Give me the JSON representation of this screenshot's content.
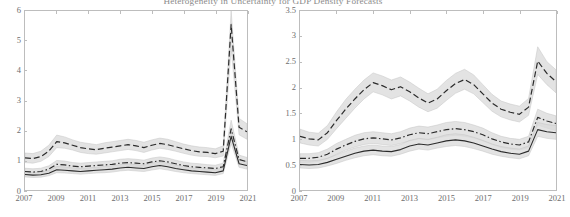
{
  "figure": {
    "title": "Heterogeneity in Uncertainty for GDP Density Forecasts",
    "background_color": "#ffffff",
    "axis_color": "#bdbdbd",
    "band_color": "#d9d9d9",
    "line_color": "#2b2b2b"
  },
  "chart_data": [
    {
      "type": "line",
      "panel": "left",
      "title": "",
      "xlabel": "",
      "ylabel": "",
      "xlim": [
        2007,
        2021
      ],
      "ylim": [
        0,
        6
      ],
      "xticks": [
        2007,
        2009,
        2011,
        2013,
        2015,
        2017,
        2019,
        2021
      ],
      "xtick_labels": [
        "2007",
        "2009",
        "2011",
        "2013",
        "2015",
        "2017",
        "2019",
        "2021"
      ],
      "yticks": [
        0,
        1,
        2,
        3,
        4,
        5,
        6
      ],
      "ytick_labels": [
        "0",
        "1",
        "2",
        "3",
        "4",
        "5",
        "6"
      ],
      "grid": false,
      "legend": "none",
      "x": [
        2007,
        2007.5,
        2008,
        2008.5,
        2009,
        2009.5,
        2010,
        2010.5,
        2011,
        2011.5,
        2012,
        2012.5,
        2013,
        2013.5,
        2014,
        2014.5,
        2015,
        2015.5,
        2016,
        2016.5,
        2017,
        2017.5,
        2018,
        2018.5,
        2019,
        2019.5,
        2020,
        2020.5,
        2021
      ],
      "series": [
        {
          "name": "upper-dashed",
          "style": "dashed",
          "values": [
            1.08,
            1.05,
            1.12,
            1.3,
            1.62,
            1.58,
            1.5,
            1.42,
            1.38,
            1.35,
            1.4,
            1.44,
            1.48,
            1.52,
            1.48,
            1.42,
            1.5,
            1.56,
            1.52,
            1.45,
            1.38,
            1.32,
            1.28,
            1.26,
            1.22,
            1.3,
            5.55,
            2.1,
            1.95
          ],
          "band_lower": [
            0.92,
            0.9,
            0.96,
            1.12,
            1.42,
            1.4,
            1.34,
            1.26,
            1.22,
            1.2,
            1.24,
            1.28,
            1.32,
            1.36,
            1.32,
            1.26,
            1.34,
            1.4,
            1.36,
            1.3,
            1.23,
            1.17,
            1.13,
            1.12,
            1.08,
            1.14,
            4.75,
            1.85,
            1.7
          ],
          "band_upper": [
            1.24,
            1.22,
            1.3,
            1.5,
            1.84,
            1.78,
            1.68,
            1.6,
            1.56,
            1.52,
            1.58,
            1.62,
            1.66,
            1.7,
            1.66,
            1.6,
            1.68,
            1.74,
            1.7,
            1.62,
            1.54,
            1.48,
            1.44,
            1.42,
            1.38,
            1.48,
            6.0,
            2.4,
            2.22
          ]
        },
        {
          "name": "middle-dashdot",
          "style": "dashdot",
          "values": [
            0.62,
            0.6,
            0.62,
            0.7,
            0.86,
            0.84,
            0.8,
            0.78,
            0.8,
            0.82,
            0.84,
            0.86,
            0.9,
            0.92,
            0.9,
            0.88,
            0.94,
            0.98,
            0.94,
            0.88,
            0.82,
            0.78,
            0.76,
            0.74,
            0.72,
            0.78,
            2.05,
            1.02,
            0.95
          ],
          "band_lower": [
            0.52,
            0.5,
            0.52,
            0.6,
            0.74,
            0.72,
            0.69,
            0.67,
            0.69,
            0.71,
            0.73,
            0.75,
            0.78,
            0.8,
            0.78,
            0.76,
            0.82,
            0.86,
            0.82,
            0.77,
            0.71,
            0.67,
            0.65,
            0.64,
            0.62,
            0.67,
            1.78,
            0.88,
            0.82
          ],
          "band_upper": [
            0.73,
            0.71,
            0.73,
            0.81,
            0.99,
            0.97,
            0.92,
            0.9,
            0.92,
            0.94,
            0.96,
            0.98,
            1.03,
            1.05,
            1.03,
            1.0,
            1.07,
            1.11,
            1.07,
            1.0,
            0.94,
            0.9,
            0.88,
            0.85,
            0.83,
            0.9,
            2.34,
            1.17,
            1.09
          ]
        },
        {
          "name": "lower-solid",
          "style": "solid",
          "values": [
            0.52,
            0.5,
            0.51,
            0.56,
            0.68,
            0.66,
            0.64,
            0.62,
            0.64,
            0.66,
            0.68,
            0.7,
            0.74,
            0.76,
            0.74,
            0.72,
            0.78,
            0.82,
            0.78,
            0.72,
            0.68,
            0.64,
            0.62,
            0.6,
            0.58,
            0.64,
            1.8,
            0.88,
            0.82
          ],
          "band_lower": [
            0.44,
            0.42,
            0.43,
            0.48,
            0.58,
            0.57,
            0.55,
            0.53,
            0.55,
            0.57,
            0.58,
            0.6,
            0.64,
            0.66,
            0.64,
            0.62,
            0.67,
            0.71,
            0.67,
            0.62,
            0.58,
            0.55,
            0.53,
            0.51,
            0.49,
            0.55,
            1.56,
            0.76,
            0.7
          ],
          "band_upper": [
            0.61,
            0.59,
            0.6,
            0.65,
            0.79,
            0.77,
            0.74,
            0.72,
            0.74,
            0.76,
            0.79,
            0.81,
            0.85,
            0.87,
            0.85,
            0.83,
            0.9,
            0.94,
            0.9,
            0.83,
            0.79,
            0.74,
            0.72,
            0.7,
            0.68,
            0.74,
            2.06,
            1.01,
            0.95
          ]
        }
      ]
    },
    {
      "type": "line",
      "panel": "right",
      "title": "",
      "xlabel": "",
      "ylabel": "",
      "xlim": [
        2007,
        2021
      ],
      "ylim": [
        0,
        3.5
      ],
      "xticks": [
        2007,
        2009,
        2011,
        2013,
        2015,
        2017,
        2019,
        2021
      ],
      "xtick_labels": [
        "2007",
        "2009",
        "2011",
        "2013",
        "2015",
        "2017",
        "2019",
        "2021"
      ],
      "yticks": [
        0,
        0.5,
        1,
        1.5,
        2,
        2.5,
        3,
        3.5
      ],
      "ytick_labels": [
        "0",
        "0.5",
        "1",
        "1.5",
        "2",
        "2.5",
        "3",
        "3.5"
      ],
      "grid": false,
      "legend": "none",
      "x": [
        2007,
        2007.5,
        2008,
        2008.5,
        2009,
        2009.5,
        2010,
        2010.5,
        2011,
        2011.5,
        2012,
        2012.5,
        2013,
        2013.5,
        2014,
        2014.5,
        2015,
        2015.5,
        2016,
        2016.5,
        2017,
        2017.5,
        2018,
        2018.5,
        2019,
        2019.5,
        2020,
        2020.5,
        2021
      ],
      "series": [
        {
          "name": "upper-dashed",
          "style": "dashed",
          "values": [
            1.05,
            1.0,
            0.98,
            1.12,
            1.36,
            1.58,
            1.78,
            1.96,
            2.1,
            2.04,
            1.96,
            2.02,
            1.92,
            1.8,
            1.7,
            1.78,
            1.94,
            2.08,
            2.16,
            2.06,
            1.88,
            1.7,
            1.58,
            1.52,
            1.48,
            1.62,
            2.52,
            2.28,
            2.12
          ],
          "band_lower": [
            0.92,
            0.88,
            0.86,
            0.99,
            1.2,
            1.4,
            1.6,
            1.78,
            1.92,
            1.86,
            1.78,
            1.84,
            1.74,
            1.62,
            1.53,
            1.6,
            1.75,
            1.89,
            1.97,
            1.88,
            1.71,
            1.54,
            1.43,
            1.37,
            1.33,
            1.46,
            2.26,
            2.06,
            1.9
          ],
          "band_upper": [
            1.19,
            1.13,
            1.11,
            1.26,
            1.53,
            1.77,
            1.97,
            2.15,
            2.29,
            2.23,
            2.15,
            2.21,
            2.11,
            1.99,
            1.88,
            1.97,
            2.14,
            2.28,
            2.36,
            2.25,
            2.06,
            1.87,
            1.74,
            1.68,
            1.64,
            1.79,
            2.8,
            2.51,
            2.35
          ]
        },
        {
          "name": "middle-dashdot",
          "style": "dashdot",
          "values": [
            0.62,
            0.62,
            0.64,
            0.7,
            0.8,
            0.88,
            0.95,
            1.0,
            1.02,
            1.0,
            0.98,
            1.02,
            1.08,
            1.12,
            1.1,
            1.14,
            1.18,
            1.2,
            1.18,
            1.14,
            1.08,
            1.0,
            0.94,
            0.9,
            0.88,
            0.94,
            1.42,
            1.35,
            1.3
          ],
          "band_lower": [
            0.54,
            0.54,
            0.56,
            0.61,
            0.7,
            0.78,
            0.84,
            0.89,
            0.91,
            0.89,
            0.87,
            0.91,
            0.96,
            1.0,
            0.98,
            1.02,
            1.05,
            1.07,
            1.05,
            1.02,
            0.96,
            0.89,
            0.83,
            0.8,
            0.78,
            0.83,
            1.27,
            1.21,
            1.16
          ],
          "band_upper": [
            0.71,
            0.71,
            0.73,
            0.8,
            0.91,
            0.99,
            1.07,
            1.12,
            1.14,
            1.12,
            1.1,
            1.14,
            1.21,
            1.25,
            1.23,
            1.27,
            1.32,
            1.34,
            1.32,
            1.27,
            1.21,
            1.12,
            1.05,
            1.01,
            0.99,
            1.05,
            1.58,
            1.5,
            1.45
          ]
        },
        {
          "name": "lower-solid",
          "style": "solid",
          "values": [
            0.5,
            0.49,
            0.5,
            0.54,
            0.6,
            0.66,
            0.72,
            0.76,
            0.78,
            0.76,
            0.75,
            0.79,
            0.86,
            0.9,
            0.88,
            0.92,
            0.96,
            0.98,
            0.96,
            0.92,
            0.86,
            0.8,
            0.75,
            0.72,
            0.7,
            0.76,
            1.18,
            1.14,
            1.12
          ],
          "band_lower": [
            0.43,
            0.42,
            0.43,
            0.47,
            0.52,
            0.58,
            0.63,
            0.67,
            0.69,
            0.67,
            0.66,
            0.7,
            0.76,
            0.8,
            0.78,
            0.82,
            0.85,
            0.87,
            0.85,
            0.81,
            0.76,
            0.7,
            0.66,
            0.63,
            0.61,
            0.67,
            1.05,
            1.01,
            0.99
          ],
          "band_upper": [
            0.58,
            0.57,
            0.58,
            0.62,
            0.69,
            0.76,
            0.82,
            0.86,
            0.88,
            0.86,
            0.85,
            0.89,
            0.97,
            1.01,
            0.99,
            1.03,
            1.08,
            1.1,
            1.08,
            1.03,
            0.97,
            0.9,
            0.85,
            0.82,
            0.8,
            0.86,
            1.32,
            1.28,
            1.26
          ]
        }
      ]
    }
  ]
}
